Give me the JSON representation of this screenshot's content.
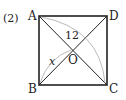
{
  "problem_label": "(2)",
  "vertices": {
    "A": {
      "label": "A",
      "x": 39,
      "y": 16
    },
    "D": {
      "label": "D",
      "x": 107,
      "y": 16
    },
    "B": {
      "label": "B",
      "x": 39,
      "y": 85
    },
    "C": {
      "label": "C",
      "x": 107,
      "y": 85
    },
    "O": {
      "label": "O",
      "x": 73,
      "y": 50
    }
  },
  "measures": {
    "diagonal_AC": "12",
    "segment_BO": "x"
  },
  "colors": {
    "stroke": "#222222",
    "arc": "#aaaaaa"
  }
}
